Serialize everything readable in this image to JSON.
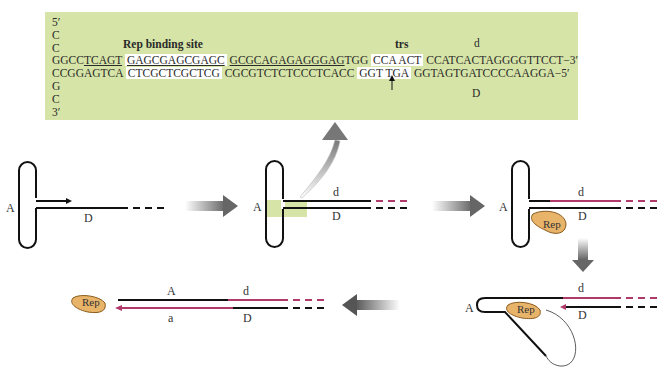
{
  "sequence_panel": {
    "five_prime": "5′",
    "c1": "C",
    "c2": "C",
    "rep_binding_site_label": "Rep binding site",
    "trs_label": "trs",
    "d_label": "d",
    "top_strand": {
      "seg1_plain": "GGCC",
      "seg1_ul": "TCAGT",
      "seg2_box": "GAGCGAGCGAGC",
      "seg3_ul": "GCGCAGAGAGGGAG",
      "seg3_plain": "TGG",
      "seg4_box": "CCA ACT",
      "seg5": "CCATCACTAGGGGTTCCT",
      "end": "−3′"
    },
    "bottom_strand": {
      "seg1": "CCGGAGTCA",
      "seg2_box": "CTCGCTCGCTCG",
      "seg3": "CGCGTCTCTCCCTCACC",
      "seg4_box": "GGT TGA",
      "seg5": "GGTAGTGATCCCCAAGGA",
      "end": "−5′"
    },
    "g1": "G",
    "c3": "C",
    "three_prime": "3′",
    "D_label": "D"
  },
  "steps": [
    {
      "A": "A",
      "D": "D"
    },
    {
      "A": "A",
      "d": "d",
      "D": "D"
    },
    {
      "A": "A",
      "d": "d",
      "D": "D",
      "rep": "Rep"
    },
    {
      "A": "A",
      "d": "d",
      "D": "D",
      "rep": "Rep"
    },
    {
      "A": "A",
      "d": "d",
      "a": "a",
      "D": "D",
      "rep": "Rep"
    }
  ],
  "colors": {
    "green_box": "#d6e5a7",
    "strand_black": "#111111",
    "strand_magenta": "#b03a6a",
    "rep_fill": "#e8b46a",
    "arrow_gray": "#6d6d6d"
  }
}
